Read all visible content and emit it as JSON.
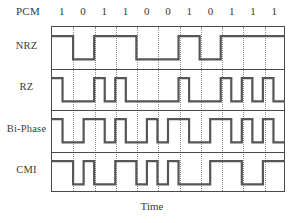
{
  "figure": {
    "pcm_label": "PCM",
    "xaxis_label": "Time",
    "bits": [
      "1",
      "0",
      "1",
      "1",
      "0",
      "0",
      "1",
      "0",
      "1",
      "1",
      "1"
    ],
    "row_labels": [
      "NRZ",
      "RZ",
      "Bi-Phase",
      "CMI"
    ],
    "line_color": "#565656",
    "frame_color": "#4a4a4a",
    "grid_color": "#8c8c8c",
    "background": "#ffffff"
  },
  "chart_data": {
    "type": "line",
    "title": "",
    "subtitle": "",
    "xlabel": "Time",
    "ylabel": "",
    "grid": true,
    "legend_position": "left",
    "bit_sequence": [
      "1",
      "0",
      "1",
      "1",
      "0",
      "0",
      "1",
      "0",
      "1",
      "1",
      "1"
    ],
    "bit_count": 11,
    "xlim": [
      0,
      11
    ],
    "ylim": [
      0,
      1
    ],
    "axis_ticks": [
      0,
      1,
      2,
      3,
      4,
      5,
      6,
      7,
      8,
      9,
      10,
      11
    ],
    "annotations": [
      "PCM",
      "NRZ",
      "RZ",
      "Bi-Phase",
      "CMI",
      "Time"
    ],
    "series": [
      {
        "name": "NRZ",
        "description": "Non-return-to-zero: level high for whole bit if 1, low if 0",
        "levels_per_half_bit": [
          1,
          1,
          0,
          0,
          1,
          1,
          1,
          1,
          0,
          0,
          0,
          0,
          1,
          1,
          0,
          0,
          1,
          1,
          1,
          1,
          1,
          1
        ]
      },
      {
        "name": "RZ",
        "description": "Return-to-zero: high for first half bit if 1, low otherwise",
        "levels_per_half_bit": [
          1,
          0,
          0,
          0,
          1,
          0,
          1,
          0,
          0,
          0,
          0,
          0,
          1,
          0,
          0,
          0,
          1,
          0,
          1,
          0,
          1,
          0
        ]
      },
      {
        "name": "Bi-Phase",
        "description": "Manchester: 1 = high then low, 0 = low then high",
        "levels_per_half_bit": [
          1,
          0,
          0,
          1,
          1,
          0,
          1,
          0,
          0,
          1,
          0,
          1,
          1,
          0,
          0,
          1,
          1,
          0,
          1,
          0,
          1,
          0
        ]
      },
      {
        "name": "CMI",
        "description": "Coded mark inversion: 1 alternates full high / full low, 0 = low then high",
        "levels_per_half_bit": [
          1,
          1,
          0,
          1,
          0,
          0,
          1,
          1,
          0,
          1,
          0,
          1,
          0,
          0,
          0,
          1,
          1,
          1,
          0,
          0,
          1,
          1
        ]
      }
    ]
  }
}
